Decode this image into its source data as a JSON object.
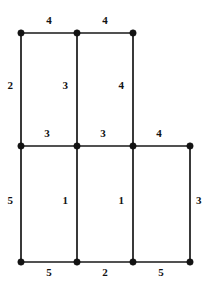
{
  "figure": {
    "width": 212,
    "height": 290,
    "background_color": "#ffffff",
    "line_color": "#171717",
    "node_color": "#131313",
    "label_color": "#121212"
  },
  "chart_data": {
    "type": "diagram",
    "subtype": "weighted-undirected-graph",
    "title": "",
    "xlabel": "",
    "ylabel": "",
    "grid": false,
    "legend": false,
    "columns_x": [
      21,
      77,
      133,
      190
    ],
    "rows_y": [
      33,
      146,
      262
    ],
    "nodes": [
      {
        "id": "A",
        "x": 21,
        "y": 33,
        "r": 3.2
      },
      {
        "id": "B",
        "x": 77,
        "y": 33,
        "r": 3.2
      },
      {
        "id": "C",
        "x": 133,
        "y": 33,
        "r": 3.2
      },
      {
        "id": "D",
        "x": 21,
        "y": 146,
        "r": 3.2
      },
      {
        "id": "E",
        "x": 77,
        "y": 146,
        "r": 3.2
      },
      {
        "id": "F",
        "x": 133,
        "y": 146,
        "r": 3.2
      },
      {
        "id": "G",
        "x": 190,
        "y": 146,
        "r": 3.2
      },
      {
        "id": "H",
        "x": 21,
        "y": 262,
        "r": 3.2
      },
      {
        "id": "I",
        "x": 77,
        "y": 262,
        "r": 3.2
      },
      {
        "id": "J",
        "x": 133,
        "y": 262,
        "r": 3.2
      },
      {
        "id": "K",
        "x": 190,
        "y": 262,
        "r": 3.2
      }
    ],
    "edges": [
      {
        "id": "e1",
        "from": "A",
        "to": "B",
        "weight": "4",
        "orientation": "horizontal",
        "x1": 21,
        "y1": 33,
        "x2": 77,
        "y2": 33,
        "label_x": 49,
        "label_y": 21,
        "label_anchor": "center"
      },
      {
        "id": "e2",
        "from": "B",
        "to": "C",
        "weight": "4",
        "orientation": "horizontal",
        "x1": 77,
        "y1": 33,
        "x2": 133,
        "y2": 33,
        "label_x": 105,
        "label_y": 21,
        "label_anchor": "center"
      },
      {
        "id": "e3",
        "from": "A",
        "to": "D",
        "weight": "2",
        "orientation": "vertical",
        "x1": 21,
        "y1": 33,
        "x2": 21,
        "y2": 146,
        "label_x": 13,
        "label_y": 86,
        "label_anchor": "left"
      },
      {
        "id": "e4",
        "from": "B",
        "to": "E",
        "weight": "3",
        "orientation": "vertical",
        "x1": 77,
        "y1": 33,
        "x2": 77,
        "y2": 146,
        "label_x": 68,
        "label_y": 86,
        "label_anchor": "left"
      },
      {
        "id": "e5",
        "from": "C",
        "to": "F",
        "weight": "4",
        "orientation": "vertical",
        "x1": 133,
        "y1": 33,
        "x2": 133,
        "y2": 146,
        "label_x": 124,
        "label_y": 86,
        "label_anchor": "left"
      },
      {
        "id": "e6",
        "from": "D",
        "to": "E",
        "weight": "3",
        "orientation": "horizontal",
        "x1": 21,
        "y1": 146,
        "x2": 77,
        "y2": 146,
        "label_x": 47,
        "label_y": 134,
        "label_anchor": "center"
      },
      {
        "id": "e7",
        "from": "E",
        "to": "F",
        "weight": "3",
        "orientation": "horizontal",
        "x1": 77,
        "y1": 146,
        "x2": 133,
        "y2": 146,
        "label_x": 103,
        "label_y": 134,
        "label_anchor": "center"
      },
      {
        "id": "e8",
        "from": "F",
        "to": "G",
        "weight": "4",
        "orientation": "horizontal",
        "x1": 133,
        "y1": 146,
        "x2": 190,
        "y2": 146,
        "label_x": 159,
        "label_y": 134,
        "label_anchor": "center"
      },
      {
        "id": "e9",
        "from": "D",
        "to": "H",
        "weight": "5",
        "orientation": "vertical",
        "x1": 21,
        "y1": 146,
        "x2": 21,
        "y2": 262,
        "label_x": 13,
        "label_y": 201,
        "label_anchor": "left"
      },
      {
        "id": "e10",
        "from": "E",
        "to": "I",
        "weight": "1",
        "orientation": "vertical",
        "x1": 77,
        "y1": 146,
        "x2": 77,
        "y2": 262,
        "label_x": 68,
        "label_y": 201,
        "label_anchor": "left"
      },
      {
        "id": "e11",
        "from": "F",
        "to": "J",
        "weight": "1",
        "orientation": "vertical",
        "x1": 133,
        "y1": 146,
        "x2": 133,
        "y2": 262,
        "label_x": 124,
        "label_y": 201,
        "label_anchor": "left"
      },
      {
        "id": "e12",
        "from": "G",
        "to": "K",
        "weight": "3",
        "orientation": "vertical",
        "x1": 190,
        "y1": 146,
        "x2": 190,
        "y2": 262,
        "label_x": 196,
        "label_y": 201,
        "label_anchor": "right"
      },
      {
        "id": "e13",
        "from": "H",
        "to": "I",
        "weight": "5",
        "orientation": "horizontal",
        "x1": 21,
        "y1": 262,
        "x2": 77,
        "y2": 262,
        "label_x": 49,
        "label_y": 273,
        "label_anchor": "center"
      },
      {
        "id": "e14",
        "from": "I",
        "to": "J",
        "weight": "2",
        "orientation": "horizontal",
        "x1": 77,
        "y1": 262,
        "x2": 133,
        "y2": 262,
        "label_x": 105,
        "label_y": 273,
        "label_anchor": "center"
      },
      {
        "id": "e15",
        "from": "J",
        "to": "K",
        "weight": "5",
        "orientation": "horizontal",
        "x1": 133,
        "y1": 262,
        "x2": 190,
        "y2": 262,
        "label_x": 161,
        "label_y": 273,
        "label_anchor": "center"
      }
    ],
    "weights_in_reading_order": [
      "4",
      "4",
      "2",
      "3",
      "4",
      "3",
      "3",
      "4",
      "5",
      "1",
      "1",
      "3",
      "5",
      "2",
      "5"
    ]
  }
}
